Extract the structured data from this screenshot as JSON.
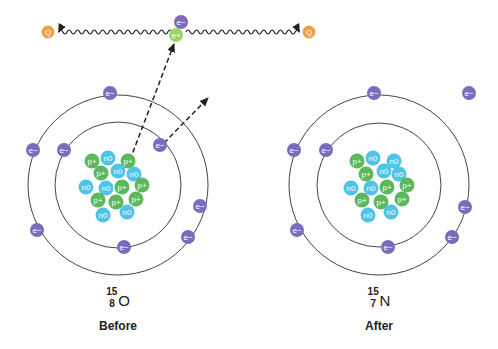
{
  "colors": {
    "electron": "#7b6bbd",
    "positron": "#9bd46a",
    "proton": "#5cb85c",
    "neutron": "#4fc3e8",
    "photon": "#f0a040",
    "orbit": "#444444"
  },
  "particle_labels": {
    "electron": "e−",
    "positron": "e+",
    "proton": "p+",
    "neutron": "n0",
    "photon": "Q"
  },
  "annihilation": {
    "photon_left": {
      "x": 48,
      "y": 32
    },
    "photon_right": {
      "x": 309,
      "y": 32
    },
    "electron": {
      "x": 181,
      "y": 22
    },
    "positron": {
      "x": 176,
      "y": 35
    }
  },
  "before": {
    "caption": "Before",
    "isotope": {
      "mass": "15",
      "number": "8",
      "symbol": "O"
    },
    "center": {
      "x": 118,
      "y": 185
    },
    "outer_r": 90,
    "inner_r": 63,
    "inner_electrons": [
      [
        64,
        150
      ],
      [
        160,
        145
      ],
      [
        124,
        247
      ]
    ],
    "outer_electrons": [
      [
        110,
        93
      ],
      [
        33,
        150
      ],
      [
        37,
        230
      ],
      [
        200,
        206
      ],
      [
        188,
        237
      ]
    ],
    "nucleus": [
      [
        "p",
        92,
        161
      ],
      [
        "n",
        108,
        158
      ],
      [
        "p",
        128,
        161
      ],
      [
        "p",
        101,
        173
      ],
      [
        "n",
        118,
        171
      ],
      [
        "n",
        134,
        174
      ],
      [
        "n",
        86,
        187
      ],
      [
        "n",
        106,
        188
      ],
      [
        "p",
        122,
        187
      ],
      [
        "p",
        142,
        185
      ],
      [
        "p",
        98,
        200
      ],
      [
        "p",
        116,
        202
      ],
      [
        "p",
        136,
        199
      ],
      [
        "n",
        103,
        215
      ],
      [
        "n",
        127,
        212
      ]
    ]
  },
  "after": {
    "caption": "After",
    "isotope": {
      "mass": "15",
      "number": "7",
      "symbol": "N"
    },
    "center": {
      "x": 379,
      "y": 185
    },
    "outer_r": 90,
    "inner_r": 62,
    "inner_electrons": [
      [
        326,
        150
      ],
      [
        388,
        247
      ]
    ],
    "outer_electrons": [
      [
        374,
        93
      ],
      [
        294,
        150
      ],
      [
        297,
        230
      ],
      [
        465,
        207
      ],
      [
        452,
        237
      ]
    ],
    "free_electron": [
      469,
      93
    ],
    "nucleus": [
      [
        "p",
        357,
        161
      ],
      [
        "n",
        373,
        158
      ],
      [
        "n",
        394,
        161
      ],
      [
        "p",
        366,
        174
      ],
      [
        "n",
        384,
        171
      ],
      [
        "n",
        399,
        174
      ],
      [
        "n",
        351,
        188
      ],
      [
        "n",
        371,
        188
      ],
      [
        "p",
        387,
        187
      ],
      [
        "p",
        407,
        185
      ],
      [
        "p",
        362,
        200
      ],
      [
        "p",
        381,
        202
      ],
      [
        "p",
        402,
        199
      ],
      [
        "n",
        368,
        215
      ],
      [
        "n",
        391,
        212
      ]
    ]
  },
  "arrows": {
    "positron_path": {
      "from": [
        130,
        160
      ],
      "to": [
        174,
        44
      ]
    },
    "electron_path": {
      "from": [
        164,
        143
      ],
      "to": [
        208,
        98
      ]
    }
  }
}
